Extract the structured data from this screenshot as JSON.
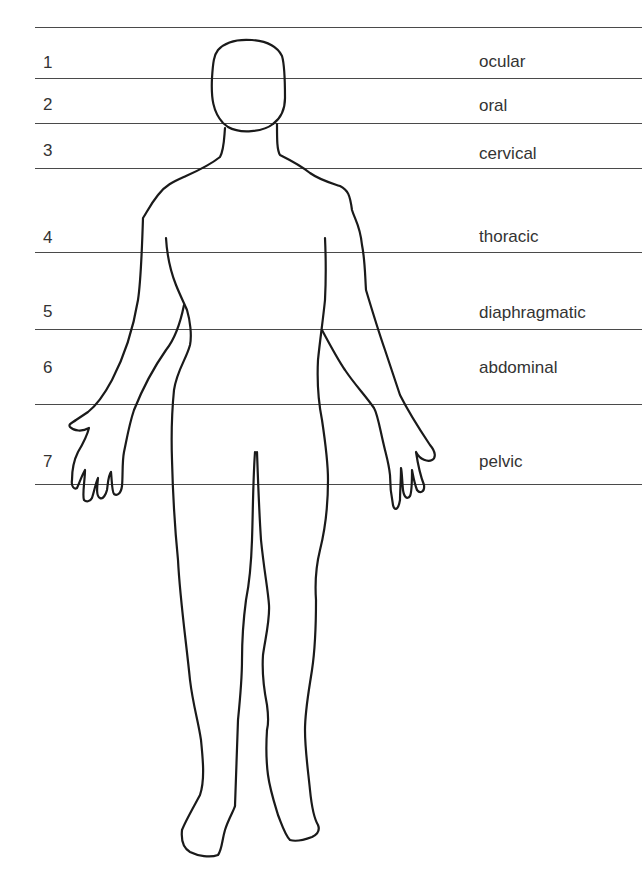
{
  "diagram": {
    "type": "body-region-levels",
    "lines_y": [
      28,
      79,
      124,
      169,
      253,
      330,
      405,
      485
    ],
    "regions": [
      {
        "number": "1",
        "label": "ocular",
        "y": 62
      },
      {
        "number": "2",
        "label": "oral",
        "y": 105
      },
      {
        "number": "3",
        "label": "cervical",
        "y": 151
      },
      {
        "number": "4",
        "label": "thoracic",
        "y": 237
      },
      {
        "number": "5",
        "label": "diaphragmatic",
        "y": 312
      },
      {
        "number": "6",
        "label": "abdominal",
        "y": 368
      },
      {
        "number": "7",
        "label": "pelvic",
        "y": 462
      }
    ],
    "colors": {
      "line": "#4a4a4a",
      "outline": "#1a1a1a",
      "text": "#333333",
      "background": "#ffffff"
    }
  }
}
